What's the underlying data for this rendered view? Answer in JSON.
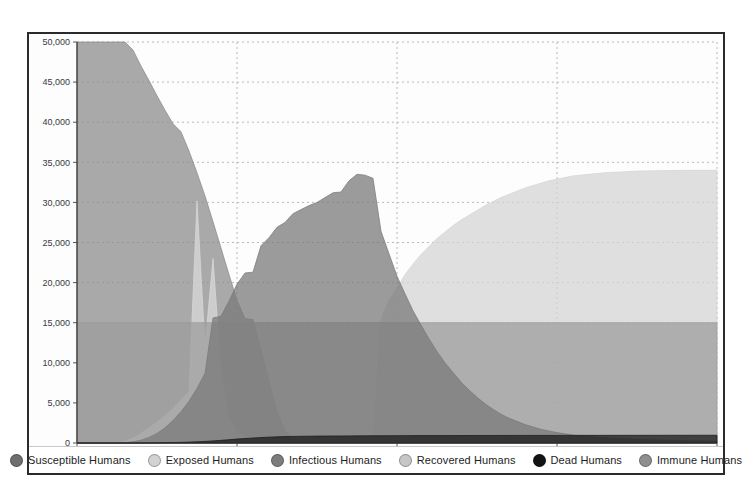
{
  "chart_data": {
    "type": "area",
    "title": "",
    "subtitle": "",
    "xlabel": "",
    "ylabel": "",
    "xlim": [
      0,
      80
    ],
    "ylim": [
      0,
      50000
    ],
    "grid": true,
    "grid_style": "dotted",
    "legend_position": "bottom",
    "stacked": false,
    "fill_opacity": 0.75,
    "x_ticks": [
      0,
      20,
      40,
      60,
      80
    ],
    "x_tick_labels": [
      "0",
      "20",
      "40",
      "60",
      "80"
    ],
    "y_ticks": [
      0,
      5000,
      10000,
      15000,
      20000,
      25000,
      30000,
      35000,
      40000,
      45000,
      50000
    ],
    "y_tick_labels": [
      "0",
      "5,000",
      "10,000",
      "15,000",
      "20,000",
      "25,000",
      "30,000",
      "35,000",
      "40,000",
      "45,000",
      "50,000"
    ],
    "x": [
      0,
      1,
      2,
      3,
      4,
      5,
      6,
      7,
      8,
      9,
      10,
      11,
      12,
      13,
      14,
      15,
      16,
      17,
      18,
      19,
      20,
      21,
      22,
      23,
      24,
      25,
      26,
      27,
      28,
      29,
      30,
      31,
      32,
      33,
      34,
      35,
      36,
      37,
      38,
      39,
      40,
      41,
      42,
      43,
      44,
      45,
      46,
      47,
      48,
      49,
      50,
      51,
      52,
      53,
      54,
      55,
      56,
      57,
      58,
      59,
      60,
      61,
      62,
      63,
      64,
      65,
      66,
      67,
      68,
      69,
      70,
      71,
      72,
      73,
      74,
      75,
      76,
      77,
      78,
      79,
      80
    ],
    "series": [
      {
        "name": "Susceptible Humans",
        "color": "#8c8c8c",
        "values": [
          50000,
          50000,
          50000,
          50000,
          50000,
          50000,
          50000,
          49000,
          47000,
          45200,
          43300,
          41500,
          39800,
          38800,
          36400,
          33700,
          30800,
          27600,
          24300,
          21000,
          17800,
          15500,
          15400,
          11600,
          7700,
          3900,
          1500,
          700,
          350,
          200,
          140,
          110,
          95,
          85,
          78,
          72,
          68,
          64,
          60,
          57,
          54,
          52,
          50,
          48,
          46,
          45,
          44,
          43,
          42,
          41,
          40,
          39,
          38,
          37,
          36,
          35,
          34,
          33,
          32,
          31,
          30,
          29,
          28,
          27,
          26,
          25,
          24,
          23,
          22,
          21,
          20,
          19,
          18,
          17,
          16,
          15,
          14,
          13,
          12,
          11,
          10
        ]
      },
      {
        "name": "Exposed Humans",
        "color": "#d9d9d9",
        "values": [
          0,
          0,
          0,
          0,
          0,
          0,
          200,
          600,
          1200,
          1900,
          2600,
          3400,
          4300,
          5300,
          6400,
          30200,
          12000,
          23000,
          9000,
          3000,
          1300,
          800,
          600,
          450,
          350,
          280,
          230,
          190,
          160,
          140,
          120,
          105,
          92,
          82,
          74,
          66,
          60,
          54,
          49,
          45,
          41,
          38,
          35,
          32,
          30,
          28,
          26,
          24,
          22,
          21,
          19,
          18,
          17,
          16,
          15,
          14,
          13,
          12,
          11,
          10,
          10,
          9,
          9,
          8,
          8,
          7,
          7,
          6,
          6,
          5,
          5,
          5,
          4,
          4,
          4,
          3,
          3,
          3,
          2,
          2,
          2
        ]
      },
      {
        "name": "Infectious Humans",
        "color": "#7a7a7a",
        "values": [
          0,
          0,
          0,
          0,
          0,
          0,
          50,
          150,
          350,
          700,
          1200,
          1900,
          2800,
          3900,
          5200,
          6800,
          8700,
          15600,
          15800,
          17700,
          19800,
          21200,
          21300,
          24600,
          25600,
          26900,
          27500,
          28600,
          29100,
          29600,
          30000,
          30600,
          31200,
          31300,
          32700,
          33500,
          33400,
          33000,
          26400,
          23600,
          20800,
          18600,
          16500,
          14700,
          13000,
          11400,
          10000,
          8800,
          7600,
          6600,
          5700,
          4900,
          4200,
          3600,
          3100,
          2700,
          2300,
          2000,
          1700,
          1500,
          1300,
          1150,
          1000,
          900,
          800,
          720,
          650,
          590,
          540,
          490,
          450,
          410,
          380,
          350,
          320,
          300,
          280,
          260,
          240,
          220,
          200
        ]
      },
      {
        "name": "Recovered Humans",
        "color": "#d4d4d4",
        "values": [
          0,
          0,
          0,
          0,
          0,
          0,
          0,
          0,
          0,
          0,
          0,
          0,
          0,
          0,
          0,
          0,
          0,
          0,
          0,
          0,
          0,
          0,
          0,
          0,
          0,
          0,
          0,
          0,
          0,
          0,
          0,
          0,
          0,
          0,
          0,
          0,
          0,
          0,
          15300,
          17800,
          19300,
          21000,
          22300,
          23500,
          24500,
          25500,
          26300,
          27100,
          27800,
          28400,
          29000,
          29600,
          30100,
          30600,
          31000,
          31400,
          31800,
          32100,
          32400,
          32700,
          32900,
          33100,
          33300,
          33400,
          33500,
          33600,
          33700,
          33750,
          33800,
          33850,
          33900,
          33920,
          33940,
          33960,
          33970,
          33980,
          33990,
          33995,
          34000,
          34000,
          34000
        ]
      },
      {
        "name": "Dead Humans",
        "color": "#1a1a1a",
        "values": [
          0,
          0,
          0,
          0,
          0,
          0,
          0,
          0,
          0,
          10,
          20,
          35,
          55,
          80,
          110,
          150,
          200,
          260,
          330,
          410,
          490,
          560,
          620,
          680,
          730,
          770,
          800,
          820,
          840,
          850,
          860,
          870,
          875,
          880,
          885,
          890,
          895,
          900,
          905,
          910,
          915,
          918,
          920,
          922,
          924,
          926,
          928,
          930,
          932,
          934,
          936,
          938,
          940,
          941,
          942,
          943,
          944,
          945,
          946,
          947,
          948,
          949,
          950,
          951,
          952,
          953,
          954,
          955,
          956,
          957,
          958,
          959,
          960,
          961,
          962,
          963,
          964,
          965,
          966,
          967,
          968
        ]
      },
      {
        "name": "Immune Humans",
        "color": "#9e9e9e",
        "values": [
          15000,
          15000,
          15000,
          15000,
          15000,
          15000,
          15000,
          15000,
          15000,
          15000,
          15000,
          15000,
          15000,
          15000,
          15000,
          15000,
          15000,
          15000,
          15000,
          15000,
          15000,
          15000,
          15000,
          15000,
          15000,
          15000,
          15000,
          15000,
          15000,
          15000,
          15000,
          15000,
          15000,
          15000,
          15000,
          15000,
          15000,
          15000,
          15000,
          15000,
          15000,
          15000,
          15000,
          15000,
          15000,
          15000,
          15000,
          15000,
          15000,
          15000,
          15000,
          15000,
          15000,
          15000,
          15000,
          15000,
          15000,
          15000,
          15000,
          15000,
          15000,
          15000,
          15000,
          15000,
          15000,
          15000,
          15000,
          15000,
          15000,
          15000,
          15000,
          15000,
          15000,
          15000,
          15000,
          15000,
          15000,
          15000,
          15000,
          15000,
          15000
        ]
      }
    ]
  },
  "legend": {
    "items": [
      {
        "label": "Susceptible Humans",
        "color": "#6e6e6e"
      },
      {
        "label": "Exposed Humans",
        "color": "#d2d2d2"
      },
      {
        "label": "Infectious Humans",
        "color": "#7d7d7d"
      },
      {
        "label": "Recovered Humans",
        "color": "#c6c6c6"
      },
      {
        "label": "Dead Humans",
        "color": "#131313"
      },
      {
        "label": "Immune Humans",
        "color": "#8f8f8f"
      }
    ]
  },
  "axes": {
    "y_labels": [
      "50,000",
      "45,000",
      "40,000",
      "35,000",
      "30,000",
      "25,000",
      "20,000",
      "15,000",
      "10,000",
      "5,000",
      "0"
    ],
    "x_labels": [
      "0",
      "20",
      "40",
      "60",
      "80"
    ]
  },
  "colors": {
    "frame": "#2b2b2b",
    "grid": "#b9b9b9",
    "background": "#fdfdfd",
    "tick_text": "#3a3a3a"
  }
}
